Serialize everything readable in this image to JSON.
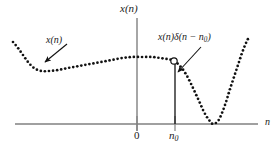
{
  "figure": {
    "background_color": "#ffffff",
    "labels": {
      "y_axis": "x(n)",
      "x_axis": "n",
      "origin": "0",
      "impulse_location_prefix": "n",
      "impulse_location_sub": "0",
      "signal_annotation": "x(n)",
      "sampled_annotation_prefix": "x(n)δ(n − n",
      "sampled_annotation_sub": "0",
      "sampled_annotation_suffix": ")"
    },
    "colors": {
      "axis": "#808080",
      "curve": "#111111",
      "stem": "#111111",
      "marker_stroke": "#111111",
      "marker_fill": "#ffffff",
      "arrow": "#111111",
      "text": "#1a1a1a"
    }
  },
  "chart_data": {
    "type": "line",
    "title": "",
    "xlabel": "n",
    "ylabel": "x(n)",
    "style": "dotted",
    "grid": false,
    "legend": false,
    "axes": {
      "x_axis_pixel_y": 124,
      "x_axis_pixel_x_start": 15,
      "x_axis_pixel_x_end": 258,
      "y_axis_pixel_x": 137,
      "y_axis_pixel_y_top": 18,
      "y_axis_pixel_y_bottom": 131
    },
    "tick_labels": {
      "x": [
        "0",
        "n0"
      ],
      "x_pixel_positions": [
        137,
        175
      ]
    },
    "series": [
      {
        "name": "x(n)",
        "style": "dotted-curve",
        "points_pixel": [
          [
            13,
            42
          ],
          [
            18,
            48
          ],
          [
            23,
            55
          ],
          [
            28,
            62
          ],
          [
            34,
            68
          ],
          [
            41,
            71
          ],
          [
            49,
            71
          ],
          [
            58,
            70
          ],
          [
            68,
            68
          ],
          [
            79,
            66
          ],
          [
            90,
            64
          ],
          [
            101,
            62
          ],
          [
            112,
            60
          ],
          [
            122,
            58
          ],
          [
            133,
            57
          ],
          [
            143,
            57
          ],
          [
            152,
            57
          ],
          [
            160,
            58
          ],
          [
            167,
            59
          ],
          [
            174,
            61
          ],
          [
            181,
            67
          ],
          [
            187,
            76
          ],
          [
            193,
            88
          ],
          [
            199,
            101
          ],
          [
            204,
            112
          ],
          [
            209,
            120
          ],
          [
            213,
            124
          ],
          [
            218,
            121
          ],
          [
            222,
            113
          ],
          [
            226,
            102
          ],
          [
            230,
            89
          ],
          [
            234,
            77
          ],
          [
            238,
            65
          ],
          [
            242,
            53
          ],
          [
            246,
            43
          ],
          [
            249,
            37
          ]
        ]
      }
    ],
    "markers": [
      {
        "name": "sampled-value-marker",
        "shape": "open-circle",
        "pixel": [
          174,
          61
        ],
        "radius": 3.2
      }
    ],
    "stems": [
      {
        "name": "impulse-stem",
        "x_pixel": 175,
        "y_top_pixel": 64,
        "y_bottom_pixel": 124
      }
    ],
    "ticks": [
      {
        "name": "origin-tick",
        "x_pixel": 137,
        "y_top_pixel": 116,
        "y_bottom_pixel": 131
      },
      {
        "name": "n0-tick",
        "x_pixel": 175,
        "y_top_pixel": 116,
        "y_bottom_pixel": 131
      }
    ],
    "annotations": [
      {
        "name": "signal-annotation",
        "text": "x(n)",
        "arrow_from_pixel": [
          67,
          44
        ],
        "arrow_to_pixel": [
          45,
          62
        ]
      },
      {
        "name": "sampled-annotation",
        "text": "x(n)δ(n − n0)",
        "arrow_from_pixel": [
          201,
          47
        ],
        "arrow_to_pixel": [
          178,
          72
        ]
      }
    ]
  }
}
